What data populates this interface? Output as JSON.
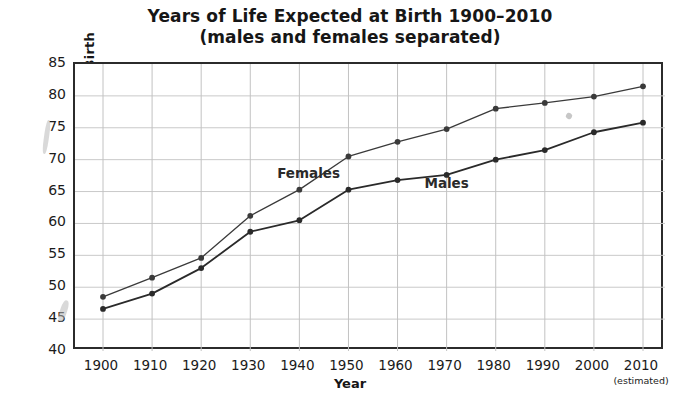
{
  "chart_data": {
    "type": "line",
    "title": "Years of Life Expected at Birth 1900–2010",
    "subtitle": "(males and females separated)",
    "xlabel": "Year",
    "ylabel": "Years of Life Expected at Birth",
    "x": [
      1900,
      1910,
      1920,
      1930,
      1940,
      1950,
      1960,
      1970,
      1980,
      1990,
      2000,
      2010
    ],
    "categories": [
      "1900",
      "1910",
      "1920",
      "1930",
      "1940",
      "1950",
      "1960",
      "1970",
      "1980",
      "1990",
      "2000",
      "2010"
    ],
    "xtick_note": "(estimated)",
    "xtick_note_at": "2010",
    "yticks": [
      40,
      45,
      50,
      55,
      60,
      65,
      70,
      75,
      80,
      85
    ],
    "ylim": [
      40,
      85
    ],
    "xlim": [
      1900,
      2010
    ],
    "grid": true,
    "legend": "inline-labels",
    "series": [
      {
        "name": "Females",
        "color": "#3a3a3a",
        "label_x": 1942,
        "label_y": 67.6,
        "values": [
          48.5,
          51.5,
          54.6,
          61.2,
          65.3,
          70.5,
          72.8,
          74.8,
          78.0,
          78.9,
          79.9,
          81.5
        ]
      },
      {
        "name": "Males",
        "color": "#2a2a2a",
        "label_x": 1972,
        "label_y": 66.0,
        "values": [
          46.6,
          49.0,
          53.0,
          58.7,
          60.5,
          65.3,
          66.8,
          67.6,
          70.0,
          71.5,
          74.3,
          75.8
        ]
      }
    ]
  }
}
